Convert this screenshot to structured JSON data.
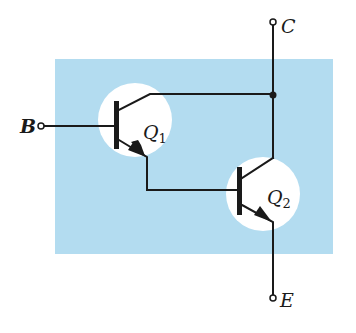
{
  "diagram": {
    "type": "circuit",
    "colors": {
      "package_fill": "#b3dcf0",
      "transistor_bg": "#ffffff",
      "wire": "#1a1a1a"
    },
    "terminals": {
      "base": "B",
      "collector": "C",
      "emitter": "E"
    },
    "transistors": [
      {
        "id": "Q1",
        "letter": "Q",
        "subscript": "1",
        "type": "NPN"
      },
      {
        "id": "Q2",
        "letter": "Q",
        "subscript": "2",
        "type": "NPN"
      }
    ],
    "connections": [
      "B -> Q1.base",
      "Q1.collector -> C",
      "Q2.collector -> C",
      "Q1.emitter -> Q2.base",
      "Q2.emitter -> E"
    ]
  }
}
